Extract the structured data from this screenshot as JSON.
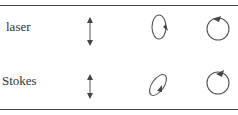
{
  "rows": [
    {
      "label": "laser",
      "linear": "vertical-double-arrow",
      "elliptical": "vertical-ellipse-clockwise-arrow",
      "circular": "circle-arrow-top"
    },
    {
      "label": "Stokes",
      "linear": "vertical-double-arrow",
      "elliptical": "tilted-ellipse-arrow-lower-right",
      "circular": "circle-arrow-top-reversed"
    }
  ],
  "colors": {
    "stroke": "#555555",
    "rule": "#444444",
    "text": "#333333"
  }
}
